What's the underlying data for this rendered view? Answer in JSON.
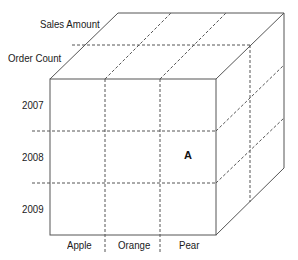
{
  "diagram": {
    "type": "olap-cube",
    "measures": [
      {
        "label": "Sales Amount"
      },
      {
        "label": "Order Count"
      }
    ],
    "years": [
      {
        "label": "2007"
      },
      {
        "label": "2008"
      },
      {
        "label": "2009"
      }
    ],
    "products": [
      {
        "label": "Apple"
      },
      {
        "label": "Orange"
      },
      {
        "label": "Pear"
      }
    ],
    "highlighted_cell": {
      "label": "A",
      "year": "2008",
      "product": "Pear"
    },
    "colors": {
      "line": "#555555",
      "dash": "#555555",
      "text": "#1a1a1a"
    }
  }
}
